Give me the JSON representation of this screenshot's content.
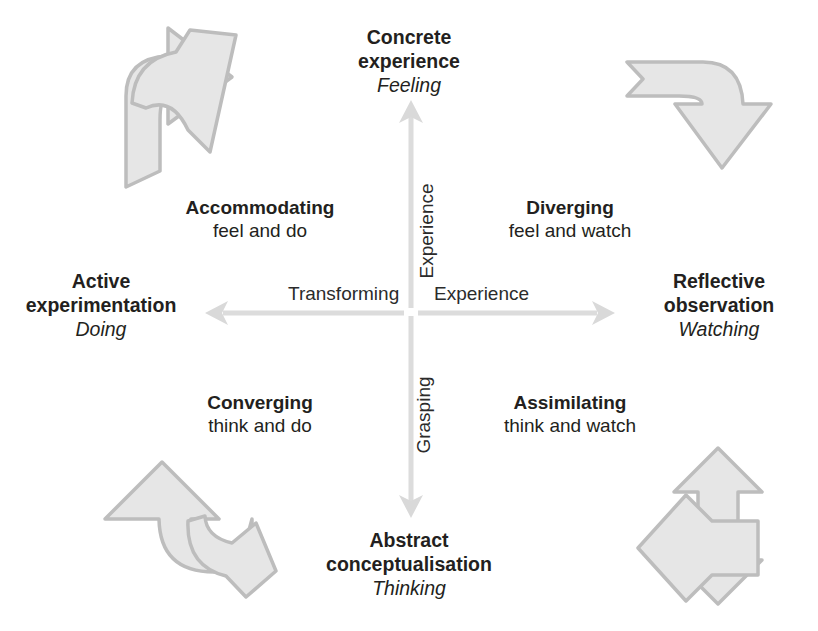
{
  "diagram": {
    "background_color": "#ffffff",
    "text_color": "#231f20",
    "axis_color": "#d4d4d4",
    "decor_arrow_fill": "#e4e4e4",
    "decor_arrow_stroke": "#b9b9b9"
  },
  "poles": {
    "top": {
      "title": "Concrete\nexperience",
      "title_line1": "Concrete",
      "title_line2": "experience",
      "subtitle": "Feeling"
    },
    "bottom": {
      "title_line1": "Abstract",
      "title_line2": "conceptualisation",
      "subtitle": "Thinking"
    },
    "left": {
      "title_line1": "Active",
      "title_line2": "experimentation",
      "subtitle": "Doing"
    },
    "right": {
      "title_line1": "Reflective",
      "title_line2": "observation",
      "subtitle": "Watching"
    }
  },
  "quadrants": {
    "top_left": {
      "title": "Accommodating",
      "subtitle": "feel and do"
    },
    "top_right": {
      "title": "Diverging",
      "subtitle": "feel and watch"
    },
    "bottom_left": {
      "title": "Converging",
      "subtitle": "think and do"
    },
    "bottom_right": {
      "title": "Assimilating",
      "subtitle": "think and watch"
    }
  },
  "axis_labels": {
    "horizontal_left": "Transforming",
    "horizontal_right": "Experience",
    "vertical_top": "Experience",
    "vertical_bottom": "Grasping"
  },
  "decor_arrows": {
    "top_left": "curved-arrow-up-right-icon",
    "top_right": "curved-arrow-down-right-icon",
    "bottom_left": "curved-arrow-up-left-icon",
    "bottom_right": "curved-arrow-down-left-icon"
  }
}
